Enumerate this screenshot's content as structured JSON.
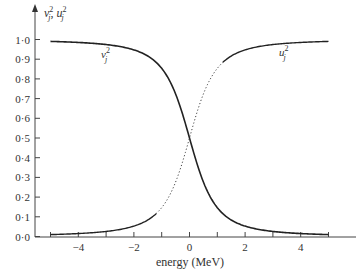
{
  "chart_data": {
    "type": "line",
    "title": "",
    "xlabel": "energy (MeV)",
    "ylabel": "v_j^2, u_j^2",
    "xlim": [
      -5,
      5
    ],
    "ylim": [
      0,
      1.0
    ],
    "grid": false,
    "legend": "none (inline curve labels)",
    "x_ticks": [
      -5,
      -4,
      -3,
      -2,
      -1,
      0,
      1,
      2,
      3,
      4,
      5
    ],
    "x_tick_labels": [
      "−4",
      "−2",
      "0",
      "2",
      "4"
    ],
    "x_tick_label_values": [
      -4,
      -2,
      0,
      2,
      4
    ],
    "y_tick_labels": [
      "0·0",
      "0·1",
      "0·2",
      "0·3",
      "0·4",
      "0·5",
      "0·6",
      "0·7",
      "0·8",
      "0·9",
      "1·0"
    ],
    "y_tick_values": [
      0.0,
      0.1,
      0.2,
      0.3,
      0.4,
      0.5,
      0.6,
      0.7,
      0.8,
      0.9,
      1.0
    ],
    "x": [
      -5,
      -4,
      -3,
      -2.5,
      -2,
      -1.5,
      -1.2,
      -1,
      -0.75,
      -0.5,
      -0.25,
      0,
      0.25,
      0.5,
      0.75,
      1,
      1.2,
      1.5,
      2,
      2.5,
      3,
      4,
      5
    ],
    "series": [
      {
        "name": "v_j^2",
        "label": "v",
        "style": "solid",
        "values": [
          0.99,
          0.985,
          0.974,
          0.964,
          0.947,
          0.916,
          0.884,
          0.854,
          0.8,
          0.724,
          0.621,
          0.5,
          0.379,
          0.276,
          0.2,
          0.146,
          0.116,
          0.084,
          0.053,
          0.036,
          0.026,
          0.015,
          0.01
        ]
      },
      {
        "name": "u_j^2",
        "label": "u",
        "style": "solid outside |E|<1.2, dotted for -1.2<E<1.2",
        "values": [
          0.01,
          0.015,
          0.026,
          0.036,
          0.053,
          0.084,
          0.116,
          0.146,
          0.2,
          0.276,
          0.379,
          0.5,
          0.621,
          0.724,
          0.8,
          0.854,
          0.884,
          0.916,
          0.947,
          0.964,
          0.974,
          0.985,
          0.99
        ]
      }
    ],
    "annotations": [
      {
        "text": "v_j^2",
        "near_x": -3.1,
        "near_y": 0.93
      },
      {
        "text": "u_j^2",
        "near_x": 3.4,
        "near_y": 0.93
      }
    ]
  },
  "labels": {
    "y_axis_v": "v",
    "y_axis_u": "u",
    "sup": "2",
    "sub": "j",
    "comma": ",",
    "x_axis_title": "energy (MeV)",
    "curve_v": "v",
    "curve_u": "u"
  }
}
